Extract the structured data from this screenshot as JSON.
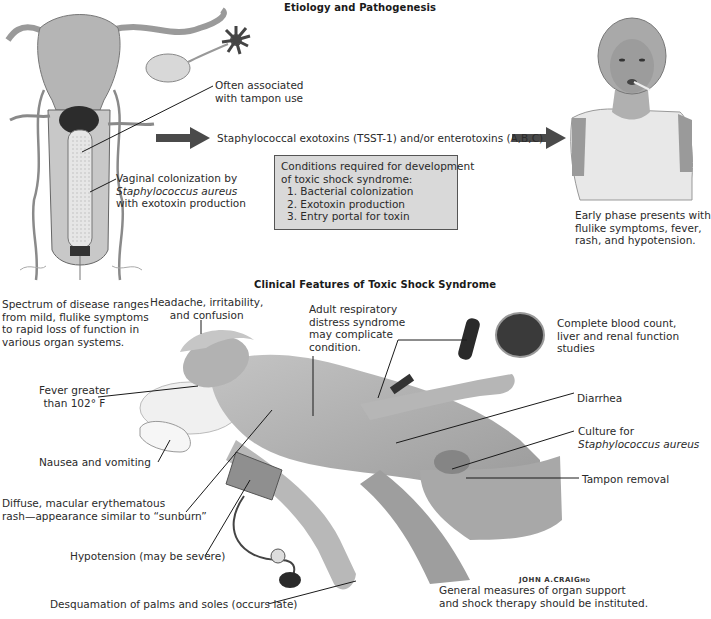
{
  "sections": {
    "etiology": {
      "title": "Etiology and Pathogenesis",
      "labels": {
        "tampon": [
          "Often associated",
          "with tampon use"
        ],
        "colonization": [
          "Vaginal colonization by",
          "Staphylococcus aureus",
          "with exotoxin production"
        ],
        "exotoxins": "Staphylococcal exotoxins (TSST-1) and/or enterotoxins (A,B,C)",
        "early_phase": [
          "Early phase presents with",
          "flulike symptoms, fever,",
          "rash, and hypotension."
        ]
      },
      "conditions_box": {
        "heading": [
          "Conditions required for development",
          "of toxic shock syndrome:"
        ],
        "items": [
          "1. Bacterial colonization",
          "2. Exotoxin production",
          "3. Entry portal for toxin"
        ]
      }
    },
    "clinical": {
      "title": "Clinical Features of Toxic Shock Syndrome",
      "labels": {
        "spectrum": [
          "Spectrum of disease ranges",
          "from mild, flulike symptoms",
          "to rapid loss of function in",
          "various organ systems."
        ],
        "headache": [
          "Headache, irritability,",
          "and confusion"
        ],
        "ards": [
          "Adult respiratory",
          "distress syndrome",
          "may complicate",
          "condition."
        ],
        "blood_tests": [
          "Complete blood count,",
          "liver and renal function",
          "studies"
        ],
        "fever": [
          "Fever greater",
          "than 102° F"
        ],
        "diarrhea": "Diarrhea",
        "culture": [
          "Culture for",
          "Staphylococcus aureus"
        ],
        "nausea": "Nausea and vomiting",
        "tampon_removal": "Tampon removal",
        "rash": [
          "Diffuse, macular erythematous",
          "rash—appearance similar to “sunburn”"
        ],
        "hypotension": "Hypotension (may be severe)",
        "desquamation": "Desquamation of palms and soles (occurs late)",
        "general_measures": [
          "General measures of organ support",
          "and shock therapy should be instituted."
        ]
      }
    }
  },
  "signature": "JOHN A.CRAIG",
  "signature_suffix": "MD",
  "colors": {
    "arrow": "#4a4a4a",
    "box_fill": "#d9d9d9",
    "box_border": "#555555",
    "skin": "#b8b8b8",
    "skin_dark": "#8f8f8f",
    "leader": "#1a1a1a"
  }
}
